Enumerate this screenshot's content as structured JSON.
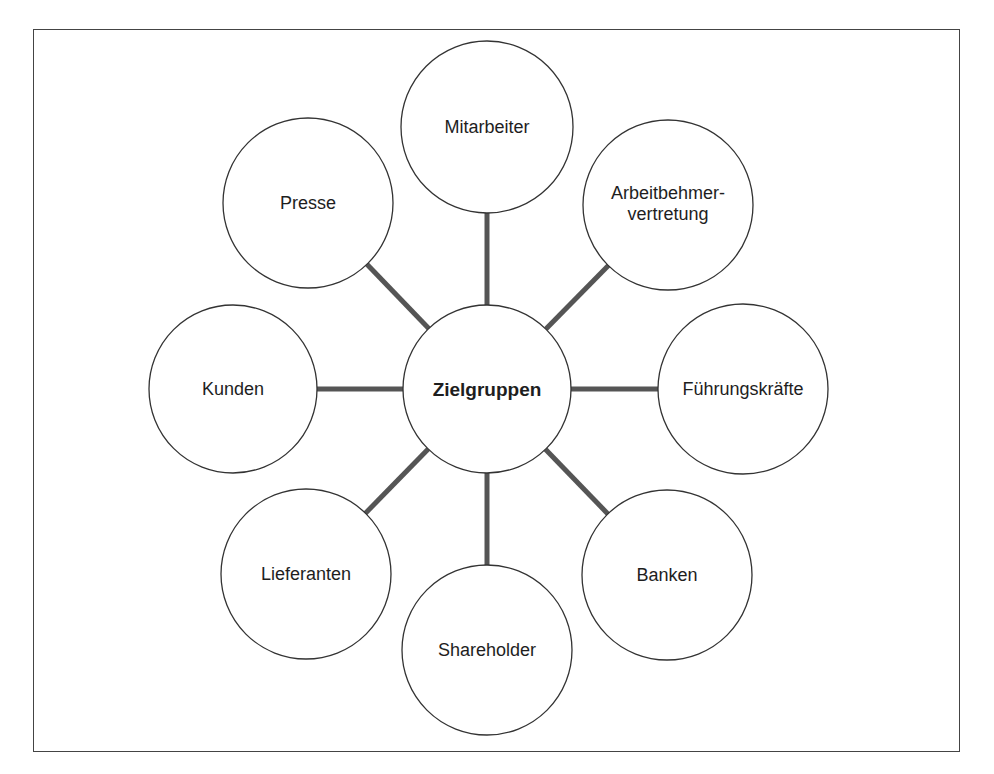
{
  "diagram": {
    "title": "Zielgruppen",
    "center": {
      "label": "Zielgruppen",
      "cx": 487,
      "cy": 389,
      "r": 84
    },
    "nodes": [
      {
        "id": "mitarbeiter",
        "label": "Mitarbeiter",
        "cx": 487,
        "cy": 127,
        "r": 86
      },
      {
        "id": "arbeitnehmervertretung",
        "label": "Arbeitbehmer-\nvertretung",
        "cx": 668,
        "cy": 205,
        "r": 85
      },
      {
        "id": "fuehrungskraefte",
        "label": "Führungskräfte",
        "cx": 743,
        "cy": 389,
        "r": 85
      },
      {
        "id": "banken",
        "label": "Banken",
        "cx": 667,
        "cy": 575,
        "r": 85
      },
      {
        "id": "shareholder",
        "label": "Shareholder",
        "cx": 487,
        "cy": 650,
        "r": 85
      },
      {
        "id": "lieferanten",
        "label": "Lieferanten",
        "cx": 306,
        "cy": 574,
        "r": 85
      },
      {
        "id": "kunden",
        "label": "Kunden",
        "cx": 233,
        "cy": 389,
        "r": 84
      },
      {
        "id": "presse",
        "label": "Presse",
        "cx": 308,
        "cy": 203,
        "r": 85
      }
    ],
    "colors": {
      "circle_stroke": "#333333",
      "connector": "#555555",
      "text": "#1e1e1e",
      "frame": "#444444"
    }
  }
}
